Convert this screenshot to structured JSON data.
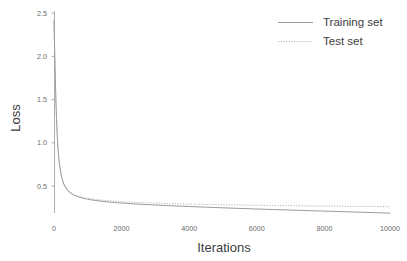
{
  "chart_data": {
    "type": "line",
    "title": "",
    "xlabel": "Iterations",
    "ylabel": "Loss",
    "xlim": [
      0,
      10000
    ],
    "ylim": [
      0.0,
      2.6
    ],
    "xticks": [
      0,
      2000,
      4000,
      6000,
      8000,
      10000
    ],
    "xtick_labels": [
      "0",
      "2000",
      "4000",
      "6000",
      "8000",
      "10000"
    ],
    "yticks": [
      0.5,
      1.0,
      1.5,
      2.0,
      2.5
    ],
    "ytick_labels": [
      "0.5",
      "1.0",
      "1.5",
      "2.0",
      "2.5"
    ],
    "grid": false,
    "legend_position": "upper right",
    "x": [
      0,
      50,
      100,
      150,
      200,
      250,
      300,
      400,
      500,
      600,
      700,
      800,
      900,
      1000,
      1200,
      1400,
      1600,
      1800,
      2000,
      2500,
      3000,
      3500,
      4000,
      4500,
      5000,
      5500,
      6000,
      6500,
      7000,
      7500,
      8000,
      8500,
      9000,
      9500,
      10000
    ],
    "series": [
      {
        "name": "Training set",
        "style": "solid",
        "color": "#9b9b9b",
        "values": [
          2.42,
          1.58,
          1.06,
          0.8,
          0.655,
          0.57,
          0.515,
          0.452,
          0.417,
          0.394,
          0.378,
          0.365,
          0.355,
          0.347,
          0.334,
          0.324,
          0.316,
          0.309,
          0.303,
          0.29,
          0.28,
          0.271,
          0.263,
          0.255,
          0.248,
          0.241,
          0.234,
          0.228,
          0.222,
          0.216,
          0.21,
          0.204,
          0.198,
          0.192,
          0.186
        ]
      },
      {
        "name": "Test set",
        "style": "dotted",
        "color": "#b4b4b4",
        "values": [
          2.42,
          1.58,
          1.07,
          0.81,
          0.662,
          0.578,
          0.523,
          0.46,
          0.425,
          0.402,
          0.387,
          0.375,
          0.366,
          0.358,
          0.346,
          0.337,
          0.33,
          0.324,
          0.319,
          0.309,
          0.302,
          0.296,
          0.291,
          0.287,
          0.283,
          0.28,
          0.277,
          0.274,
          0.272,
          0.27,
          0.268,
          0.266,
          0.264,
          0.262,
          0.26
        ]
      }
    ],
    "legend": [
      {
        "label": "Training set",
        "style": "solid",
        "color": "#9b9b9b"
      },
      {
        "label": "Test set",
        "style": "dotted",
        "color": "#b4b4b4"
      }
    ]
  }
}
